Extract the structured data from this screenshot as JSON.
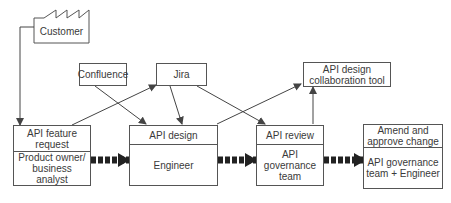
{
  "diagram": {
    "customer": {
      "label": "Customer",
      "icon": "factory-icon"
    },
    "confluence": {
      "label": "Confluence"
    },
    "jira": {
      "label": "Jira"
    },
    "collab_tool": {
      "label": "API design collaboration tool"
    },
    "feature_request": {
      "title": "API feature request",
      "role": "Product owner/ business analyst"
    },
    "api_design": {
      "title": "API design",
      "role": "Engineer"
    },
    "api_review": {
      "title": "API review",
      "role": "API governance team"
    },
    "amend": {
      "title": "Amend and approve change",
      "role": "API governance team + Engineer"
    }
  }
}
